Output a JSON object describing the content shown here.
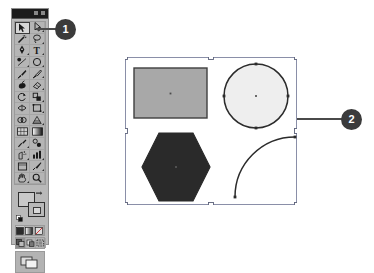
{
  "app": {
    "name": "Illustrator Toolbox",
    "background_color": "#ffffff"
  },
  "toolbox": {
    "title": "",
    "panel_color": "#b9b9b9",
    "titlebar_color": "#1c1c1c",
    "selected_tool": "selection-tool",
    "tools": [
      {
        "id": "selection-tool",
        "label": "Selection",
        "icon": "arrow-pointer-icon",
        "selected": true,
        "has_flyout": false
      },
      {
        "id": "direct-selection-tool",
        "label": "Direct Selection",
        "icon": "arrow-white-icon",
        "selected": false,
        "has_flyout": true
      },
      {
        "id": "magic-wand-tool",
        "label": "Magic Wand",
        "icon": "magic-wand-icon",
        "selected": false,
        "has_flyout": false
      },
      {
        "id": "lasso-tool",
        "label": "Lasso",
        "icon": "lasso-icon",
        "selected": false,
        "has_flyout": true
      },
      {
        "id": "pen-tool",
        "label": "Pen",
        "icon": "pen-nib-icon",
        "selected": false,
        "has_flyout": true
      },
      {
        "id": "type-tool",
        "label": "Type",
        "icon": "type-t-icon",
        "selected": false,
        "has_flyout": true
      },
      {
        "id": "line-segment-tool",
        "label": "Line Segment",
        "icon": "line-segment-icon",
        "selected": false,
        "has_flyout": true
      },
      {
        "id": "ellipse-tool",
        "label": "Ellipse",
        "icon": "ellipse-icon",
        "selected": false,
        "has_flyout": true
      },
      {
        "id": "paintbrush-tool",
        "label": "Paintbrush",
        "icon": "paintbrush-icon",
        "selected": false,
        "has_flyout": false
      },
      {
        "id": "pencil-tool",
        "label": "Pencil",
        "icon": "pencil-icon",
        "selected": false,
        "has_flyout": true
      },
      {
        "id": "blob-brush-tool",
        "label": "Blob Brush",
        "icon": "blob-brush-icon",
        "selected": false,
        "has_flyout": false
      },
      {
        "id": "eraser-tool",
        "label": "Eraser",
        "icon": "eraser-icon",
        "selected": false,
        "has_flyout": true
      },
      {
        "id": "rotate-tool",
        "label": "Rotate",
        "icon": "rotate-icon",
        "selected": false,
        "has_flyout": true
      },
      {
        "id": "scale-tool",
        "label": "Scale",
        "icon": "scale-icon",
        "selected": false,
        "has_flyout": true
      },
      {
        "id": "width-tool",
        "label": "Width",
        "icon": "width-icon",
        "selected": false,
        "has_flyout": true
      },
      {
        "id": "free-transform-tool",
        "label": "Free Transform",
        "icon": "free-transform-icon",
        "selected": false,
        "has_flyout": false
      },
      {
        "id": "shape-builder-tool",
        "label": "Shape Builder",
        "icon": "shape-builder-icon",
        "selected": false,
        "has_flyout": true
      },
      {
        "id": "perspective-grid-tool",
        "label": "Perspective Grid",
        "icon": "perspective-grid-icon",
        "selected": false,
        "has_flyout": true
      },
      {
        "id": "mesh-tool",
        "label": "Mesh",
        "icon": "mesh-icon",
        "selected": false,
        "has_flyout": false
      },
      {
        "id": "gradient-tool",
        "label": "Gradient",
        "icon": "gradient-icon",
        "selected": false,
        "has_flyout": false
      },
      {
        "id": "eyedropper-tool",
        "label": "Eyedropper",
        "icon": "eyedropper-icon",
        "selected": false,
        "has_flyout": true
      },
      {
        "id": "blend-tool",
        "label": "Blend",
        "icon": "blend-icon",
        "selected": false,
        "has_flyout": false
      },
      {
        "id": "symbol-sprayer-tool",
        "label": "Symbol Sprayer",
        "icon": "symbol-sprayer-icon",
        "selected": false,
        "has_flyout": true
      },
      {
        "id": "column-graph-tool",
        "label": "Column Graph",
        "icon": "bar-chart-icon",
        "selected": false,
        "has_flyout": true
      },
      {
        "id": "artboard-tool",
        "label": "Artboard",
        "icon": "artboard-icon",
        "selected": false,
        "has_flyout": false
      },
      {
        "id": "slice-tool",
        "label": "Slice",
        "icon": "slice-knife-icon",
        "selected": false,
        "has_flyout": true
      },
      {
        "id": "hand-tool",
        "label": "Hand",
        "icon": "hand-icon",
        "selected": false,
        "has_flyout": true
      },
      {
        "id": "zoom-tool",
        "label": "Zoom",
        "icon": "magnifier-icon",
        "selected": false,
        "has_flyout": false
      }
    ],
    "color_controls": {
      "fill": {
        "label": "Fill",
        "color": "#c9c9c9"
      },
      "stroke": {
        "label": "Stroke",
        "color": "#d7d7d7"
      },
      "swap_label": "Swap Fill and Stroke",
      "default_label": "Default Fill and Stroke"
    },
    "paint_modes": [
      {
        "id": "color-mode",
        "label": "Color",
        "active": true
      },
      {
        "id": "gradient-mode",
        "label": "Gradient",
        "active": false
      },
      {
        "id": "none-mode",
        "label": "None",
        "active": false
      }
    ],
    "draw_modes": [
      {
        "id": "draw-normal",
        "label": "Draw Normal",
        "active": true
      },
      {
        "id": "draw-behind",
        "label": "Draw Behind",
        "active": false
      },
      {
        "id": "draw-inside",
        "label": "Draw Inside",
        "active": false
      }
    ],
    "screen_mode": {
      "id": "change-screen-mode",
      "label": "Change Screen Mode"
    }
  },
  "artboard": {
    "label": "Artboard",
    "selection": {
      "label": "Selection bounding box",
      "handle_count": 8,
      "handle_color": "#ffffff",
      "box_color": "#8a8fa8"
    },
    "shapes": [
      {
        "id": "rectangle",
        "label": "Rectangle",
        "fill": "#a8a8a8",
        "stroke": "#3a3a3a",
        "center_point": true
      },
      {
        "id": "circle",
        "label": "Circle",
        "fill": "#eeeeee",
        "stroke": "#2b2b2b",
        "center_point": true,
        "anchor_points": 4
      },
      {
        "id": "hexagon",
        "label": "Hexagon",
        "fill": "#2a2a2a",
        "stroke": "#2a2a2a",
        "center_point": true
      },
      {
        "id": "arc",
        "label": "Arc",
        "fill": "none",
        "stroke": "#2b2b2b",
        "anchor_points": 2
      }
    ]
  },
  "callouts": [
    {
      "id": "callout-1",
      "number": "1",
      "label": "Toolbox callout",
      "target": "toolbox"
    },
    {
      "id": "callout-2",
      "number": "2",
      "label": "Artboard callout",
      "target": "artboard"
    }
  ]
}
